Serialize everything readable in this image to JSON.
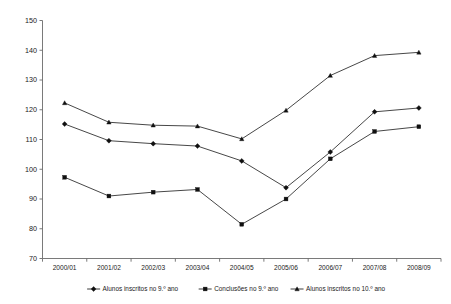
{
  "chart_data": {
    "type": "line",
    "title": "",
    "subtitle": "",
    "xlabel": "",
    "ylabel": "",
    "ylim": [
      70,
      150
    ],
    "ytick_labels": [
      "150",
      "140",
      "130",
      "120",
      "110",
      "100",
      "90",
      "80",
      "70"
    ],
    "ytick_values": [
      150,
      140,
      130,
      120,
      110,
      100,
      90,
      80,
      70
    ],
    "grid": false,
    "legend_position": "bottom",
    "categories": [
      "2000/01",
      "2001/02",
      "2002/03",
      "2003/04",
      "2004/05",
      "2005/06",
      "2006/07",
      "2007/08",
      "2008/09"
    ],
    "series": [
      {
        "name": "Alunos inscritos no 9.º ano",
        "marker": "diamond",
        "values": [
          115.2,
          109.6,
          108.6,
          107.8,
          102.8,
          93.8,
          105.8,
          119.3,
          120.6
        ]
      },
      {
        "name": "Conclusões no 9.º ano",
        "marker": "square",
        "values": [
          97.3,
          91.0,
          92.3,
          93.2,
          81.5,
          90.0,
          103.5,
          112.7,
          114.3
        ]
      },
      {
        "name": "Alunos inscritos no 10.º ano",
        "marker": "triangle",
        "values": [
          122.3,
          115.8,
          114.8,
          114.5,
          110.2,
          119.8,
          131.5,
          138.2,
          139.3
        ]
      }
    ],
    "colors": {
      "series_line": "#262626",
      "marker": "#101010",
      "axis": "#6b6b6b",
      "text": "#1a1a1a",
      "background": "#ffffff"
    }
  }
}
